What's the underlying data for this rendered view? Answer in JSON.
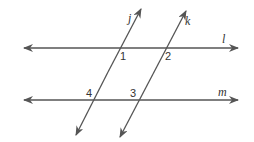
{
  "diagram": {
    "type": "parallel-lines-transversals",
    "colors": {
      "stroke": "#555555",
      "text": "#333333",
      "background": "#ffffff"
    },
    "lines": [
      {
        "name": "l",
        "label": "l",
        "kind": "horizontal",
        "from": [
          24,
          48
        ],
        "to": [
          238,
          48
        ]
      },
      {
        "name": "m",
        "label": "m",
        "kind": "horizontal",
        "from": [
          24,
          100
        ],
        "to": [
          238,
          100
        ]
      },
      {
        "name": "j",
        "label": "j",
        "kind": "transversal",
        "from": [
          76,
          135
        ],
        "to": [
          141,
          9
        ]
      },
      {
        "name": "k",
        "label": "k",
        "kind": "transversal",
        "from": [
          120,
          137
        ],
        "to": [
          186,
          11
        ]
      }
    ],
    "angles": [
      {
        "label": "1",
        "at": "j ∩ l"
      },
      {
        "label": "2",
        "at": "k ∩ l"
      },
      {
        "label": "3",
        "at": "k ∩ m"
      },
      {
        "label": "4",
        "at": "j ∩ m"
      }
    ]
  }
}
